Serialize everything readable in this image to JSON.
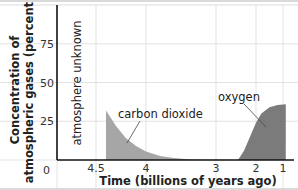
{
  "chart_data": {
    "type": "area",
    "title": "",
    "xlabel": "Time (billions of years ago)",
    "ylabel_lines": [
      "Concentration of",
      "atmospheric gases (percent)"
    ],
    "x_ticks": [
      4.5,
      4,
      3,
      2,
      1
    ],
    "x_tick_labels": [
      "4.5",
      "4",
      "3",
      "2",
      "1"
    ],
    "y_ticks": [
      0,
      25,
      50,
      75
    ],
    "y_tick_labels": [
      "0",
      "25",
      "50",
      "75"
    ],
    "ylim": [
      0,
      100
    ],
    "x_reversed": true,
    "grid": true,
    "annotations": [
      {
        "text": "atmosphere unknown",
        "region": "before ~4.4 billion years ago"
      }
    ],
    "series": [
      {
        "name": "carbon dioxide",
        "color": "#a6a6a6",
        "points": [
          [
            4.4,
            32
          ],
          [
            4.3,
            22
          ],
          [
            4.2,
            14
          ],
          [
            4.1,
            9
          ],
          [
            4.0,
            5.5
          ],
          [
            3.8,
            2.5
          ],
          [
            3.6,
            1.2
          ],
          [
            3.4,
            0.5
          ],
          [
            3.2,
            0.2
          ],
          [
            3.0,
            0.1
          ],
          [
            2.4,
            0
          ],
          [
            1.0,
            0
          ],
          [
            0.9,
            0
          ]
        ]
      },
      {
        "name": "oxygen",
        "color": "#7b7b7b",
        "points": [
          [
            2.45,
            0
          ],
          [
            2.3,
            6
          ],
          [
            2.15,
            15
          ],
          [
            2.0,
            24
          ],
          [
            1.8,
            30
          ],
          [
            1.5,
            34
          ],
          [
            1.2,
            35.5
          ],
          [
            0.9,
            36
          ]
        ]
      }
    ]
  }
}
